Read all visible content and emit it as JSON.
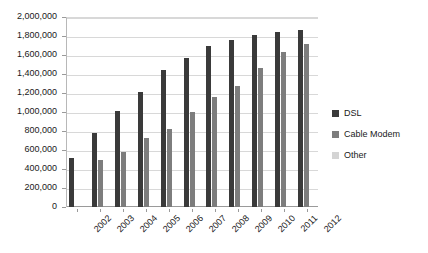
{
  "chart_data": {
    "type": "bar",
    "title": "",
    "xlabel": "",
    "ylabel": "",
    "categories": [
      "2002",
      "2003",
      "2004",
      "2005",
      "2006",
      "2007",
      "2008",
      "2009",
      "2010",
      "2011",
      "2012"
    ],
    "series": [
      {
        "name": "DSL",
        "color": "#3a3a3a",
        "values": [
          515000,
          775000,
          1010000,
          1215000,
          1440000,
          1570000,
          1695000,
          1760000,
          1810000,
          1840000,
          1860000
        ]
      },
      {
        "name": "Cable Modem",
        "color": "#7d7d7d",
        "values": [
          0,
          490000,
          580000,
          730000,
          820000,
          1000000,
          1155000,
          1275000,
          1460000,
          1630000,
          1715000
        ]
      },
      {
        "name": "Other",
        "color": "#d4d4d4",
        "values": [
          0,
          0,
          0,
          0,
          0,
          0,
          0,
          0,
          0,
          0,
          0
        ]
      }
    ],
    "ylim": [
      0,
      2000000
    ],
    "yticks": [
      0,
      200000,
      400000,
      600000,
      800000,
      1000000,
      1200000,
      1400000,
      1600000,
      1800000,
      2000000
    ],
    "ytick_labels": [
      "0",
      "200,000",
      "400,000",
      "600,000",
      "800,000",
      "1,000,000",
      "1,200,000",
      "1,400,000",
      "1,600,000",
      "1,800,000",
      "2,000,000"
    ],
    "grid": true,
    "legend_position": "right",
    "legend_entries": [
      "DSL",
      "Cable Modem",
      "Other"
    ]
  }
}
